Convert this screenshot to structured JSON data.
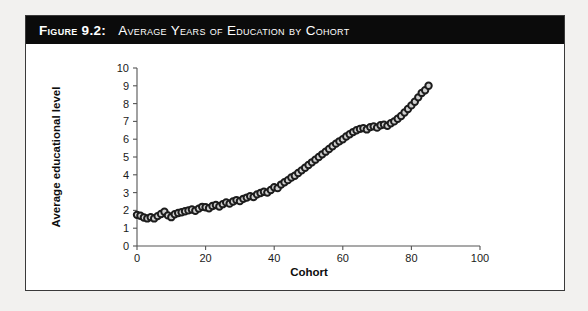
{
  "figure": {
    "title_number": "Figure 9.2:",
    "title_text": "Average Years of Education by Cohort"
  },
  "chart_data": {
    "type": "scatter",
    "title": "Average Years of Education by Cohort",
    "xlabel": "Cohort",
    "ylabel": "Average educational level",
    "xlim": [
      0,
      100
    ],
    "ylim": [
      0,
      10
    ],
    "xticks": [
      0,
      20,
      40,
      60,
      80,
      100
    ],
    "yticks": [
      0,
      1,
      2,
      3,
      4,
      5,
      6,
      7,
      8,
      9,
      10
    ],
    "xtick_labels": [
      "0",
      "20",
      "40",
      "60",
      "80",
      "100"
    ],
    "ytick_labels": [
      "0",
      "1",
      "2",
      "3",
      "4",
      "5",
      "6",
      "7",
      "8",
      "9",
      "10"
    ],
    "grid": false,
    "legend": null,
    "marker": "open-circle",
    "marker_face_color": "#cfcfcf",
    "marker_edge_color": "#1c1c1c",
    "points": [
      [
        0,
        1.75
      ],
      [
        1,
        1.7
      ],
      [
        2,
        1.6
      ],
      [
        3,
        1.55
      ],
      [
        4,
        1.62
      ],
      [
        5,
        1.55
      ],
      [
        6,
        1.68
      ],
      [
        7,
        1.8
      ],
      [
        8,
        1.92
      ],
      [
        9,
        1.72
      ],
      [
        10,
        1.62
      ],
      [
        11,
        1.78
      ],
      [
        12,
        1.85
      ],
      [
        13,
        1.9
      ],
      [
        14,
        1.95
      ],
      [
        15,
        2.0
      ],
      [
        16,
        2.05
      ],
      [
        17,
        1.98
      ],
      [
        18,
        2.1
      ],
      [
        19,
        2.2
      ],
      [
        20,
        2.18
      ],
      [
        21,
        2.12
      ],
      [
        22,
        2.25
      ],
      [
        23,
        2.3
      ],
      [
        24,
        2.22
      ],
      [
        25,
        2.35
      ],
      [
        26,
        2.45
      ],
      [
        27,
        2.38
      ],
      [
        28,
        2.5
      ],
      [
        29,
        2.58
      ],
      [
        30,
        2.52
      ],
      [
        31,
        2.65
      ],
      [
        32,
        2.72
      ],
      [
        33,
        2.8
      ],
      [
        34,
        2.75
      ],
      [
        35,
        2.9
      ],
      [
        36,
        2.98
      ],
      [
        37,
        3.05
      ],
      [
        38,
        3.0
      ],
      [
        39,
        3.15
      ],
      [
        40,
        3.3
      ],
      [
        41,
        3.25
      ],
      [
        42,
        3.45
      ],
      [
        43,
        3.58
      ],
      [
        44,
        3.7
      ],
      [
        45,
        3.85
      ],
      [
        46,
        3.95
      ],
      [
        47,
        4.1
      ],
      [
        48,
        4.25
      ],
      [
        49,
        4.4
      ],
      [
        50,
        4.55
      ],
      [
        51,
        4.7
      ],
      [
        52,
        4.85
      ],
      [
        53,
        5.0
      ],
      [
        54,
        5.15
      ],
      [
        55,
        5.3
      ],
      [
        56,
        5.45
      ],
      [
        57,
        5.6
      ],
      [
        58,
        5.75
      ],
      [
        59,
        5.88
      ],
      [
        60,
        6.0
      ],
      [
        61,
        6.15
      ],
      [
        62,
        6.28
      ],
      [
        63,
        6.4
      ],
      [
        64,
        6.5
      ],
      [
        65,
        6.58
      ],
      [
        66,
        6.62
      ],
      [
        67,
        6.55
      ],
      [
        68,
        6.68
      ],
      [
        69,
        6.72
      ],
      [
        70,
        6.65
      ],
      [
        71,
        6.78
      ],
      [
        72,
        6.82
      ],
      [
        73,
        6.75
      ],
      [
        74,
        6.9
      ],
      [
        75,
        7.0
      ],
      [
        76,
        7.15
      ],
      [
        77,
        7.3
      ],
      [
        78,
        7.5
      ],
      [
        79,
        7.7
      ],
      [
        80,
        7.9
      ],
      [
        81,
        8.1
      ],
      [
        82,
        8.35
      ],
      [
        83,
        8.6
      ],
      [
        84,
        8.75
      ],
      [
        85,
        9.0
      ]
    ]
  }
}
